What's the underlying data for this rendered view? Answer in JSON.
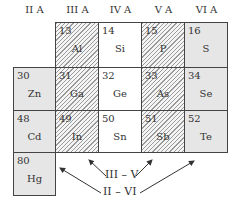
{
  "headers": [
    "II A",
    "III A",
    "IV A",
    "V A",
    "VI A"
  ],
  "cells": [
    {
      "num": "13",
      "sym": "Al",
      "col": 1,
      "row": 0,
      "fill": "hatch"
    },
    {
      "num": "14",
      "sym": "Si",
      "col": 2,
      "row": 0,
      "fill": "plain"
    },
    {
      "num": "15",
      "sym": "P",
      "col": 3,
      "row": 0,
      "fill": "hatch"
    },
    {
      "num": "16",
      "sym": "S",
      "col": 4,
      "row": 0,
      "fill": "dots"
    },
    {
      "num": "30",
      "sym": "Zn",
      "col": 0,
      "row": 1,
      "fill": "dots"
    },
    {
      "num": "31",
      "sym": "Ga",
      "col": 1,
      "row": 1,
      "fill": "hatch"
    },
    {
      "num": "32",
      "sym": "Ge",
      "col": 2,
      "row": 1,
      "fill": "plain"
    },
    {
      "num": "33",
      "sym": "As",
      "col": 3,
      "row": 1,
      "fill": "hatch"
    },
    {
      "num": "34",
      "sym": "Se",
      "col": 4,
      "row": 1,
      "fill": "dots"
    },
    {
      "num": "48",
      "sym": "Cd",
      "col": 0,
      "row": 2,
      "fill": "dots"
    },
    {
      "num": "49",
      "sym": "In",
      "col": 1,
      "row": 2,
      "fill": "hatch"
    },
    {
      "num": "50",
      "sym": "Sn",
      "col": 2,
      "row": 2,
      "fill": "plain"
    },
    {
      "num": "51",
      "sym": "Sb",
      "col": 3,
      "row": 2,
      "fill": "hatch"
    },
    {
      "num": "52",
      "sym": "Te",
      "col": 4,
      "row": 2,
      "fill": "dots"
    },
    {
      "num": "80",
      "sym": "Hg",
      "col": 0,
      "row": 3,
      "fill": "dots"
    }
  ],
  "labels": {
    "iii_v": "III – V",
    "ii_vi": "II – VI"
  }
}
